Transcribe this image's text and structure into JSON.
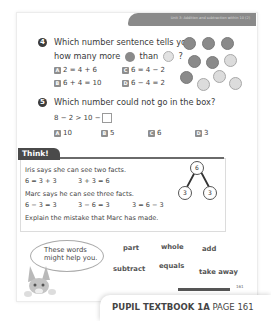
{
  "header": {
    "unit_text": "Unit 3: Addition and subtraction within 10 (2)"
  },
  "q4": {
    "number": "4",
    "line1": "Which number sentence tells you",
    "line2_before": "how many more",
    "line2_middle": "than",
    "line2_after": "?",
    "options": [
      {
        "letter": "A",
        "text": "2 = 4 + 6"
      },
      {
        "letter": "C",
        "text": "6 = 4 − 2"
      },
      {
        "letter": "B",
        "text": "6 + 4 = 10"
      },
      {
        "letter": "D",
        "text": "6 − 4 = 2"
      }
    ],
    "counters": {
      "dark": 6,
      "light": 4
    }
  },
  "q5": {
    "number": "5",
    "question": "Which number could not go in the box?",
    "equation": "8 − 2 > 10 −",
    "options": [
      {
        "letter": "A",
        "text": "10"
      },
      {
        "letter": "B",
        "text": "5"
      },
      {
        "letter": "C",
        "text": "6"
      },
      {
        "letter": "D",
        "text": "3"
      }
    ]
  },
  "think": {
    "title": "Think!",
    "iris_says": "Iris says she can see two facts.",
    "iris_facts": [
      "6 = 3 + 3",
      "3 + 3 = 6"
    ],
    "marc_says": "Marc says he can see three facts.",
    "marc_facts": [
      "6 − 3 = 3",
      "3 − 6 = 3",
      "3 = 6 − 3"
    ],
    "prompt": "Explain the mistake that Marc has made.",
    "part_whole": {
      "whole": "6",
      "parts": [
        "3",
        "3"
      ]
    }
  },
  "helper": {
    "bubble_line1": "These words",
    "bubble_line2": "might help you.",
    "words": [
      "part",
      "whole",
      "add",
      "subtract",
      "equals",
      "take away"
    ]
  },
  "footer": {
    "book": "PUPIL TEXTBOOK 1A",
    "page": "PAGE 161",
    "page_number": "161"
  }
}
